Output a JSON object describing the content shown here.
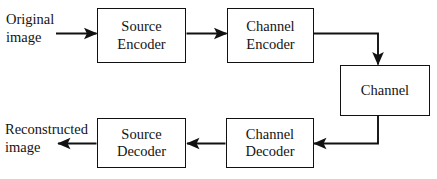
{
  "diagram": {
    "type": "flowchart",
    "background_color": "#ffffff",
    "stroke_color": "#111111",
    "text_color": "#141414",
    "labels": {
      "input": {
        "line1": "Original",
        "line2": "image"
      },
      "output": {
        "line1": "Reconstructed",
        "line2": "image"
      }
    },
    "nodes": [
      {
        "id": "source-encoder",
        "line1": "Source",
        "line2": "Encoder"
      },
      {
        "id": "channel-encoder",
        "line1": "Channel",
        "line2": "Encoder"
      },
      {
        "id": "channel",
        "line1": "Channel",
        "line2": ""
      },
      {
        "id": "channel-decoder",
        "line1": "Channel",
        "line2": "Decoder"
      },
      {
        "id": "source-decoder",
        "line1": "Source",
        "line2": "Decoder"
      }
    ],
    "edges": [
      {
        "id": "edge-input-to-source-encoder",
        "from": "Original image",
        "to": "Source Encoder",
        "direction": "right"
      },
      {
        "id": "edge-source-encoder-to-channel-encoder",
        "from": "Source Encoder",
        "to": "Channel Encoder",
        "direction": "right"
      },
      {
        "id": "edge-channel-encoder-to-channel",
        "from": "Channel Encoder",
        "to": "Channel",
        "direction": "down"
      },
      {
        "id": "edge-channel-to-channel-decoder",
        "from": "Channel",
        "to": "Channel Decoder",
        "direction": "left"
      },
      {
        "id": "edge-channel-decoder-to-source-decoder",
        "from": "Channel Decoder",
        "to": "Source Decoder",
        "direction": "left"
      },
      {
        "id": "edge-source-decoder-to-output",
        "from": "Source Decoder",
        "to": "Reconstructed image",
        "direction": "left"
      }
    ]
  }
}
